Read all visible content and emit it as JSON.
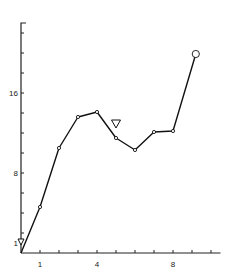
{
  "chart_data": {
    "type": "line",
    "title": "",
    "xlabel": "",
    "ylabel": "",
    "xlim": [
      0,
      10.5
    ],
    "ylim": [
      0,
      23
    ],
    "grid": false,
    "legend": null,
    "x_ticks": [
      1,
      2,
      3,
      4,
      5,
      6,
      7,
      8,
      9,
      10
    ],
    "x_tick_labels": [
      {
        "value": 1,
        "label": "1"
      },
      {
        "value": 4,
        "label": "4"
      },
      {
        "value": 8,
        "label": "8"
      }
    ],
    "y_ticks": [
      2,
      4,
      6,
      8,
      10,
      12,
      14,
      16,
      18,
      20,
      22
    ],
    "y_tick_labels": [
      {
        "value": 1,
        "label": "1"
      },
      {
        "value": 8,
        "label": "8"
      },
      {
        "value": 16,
        "label": "16"
      }
    ],
    "series": [
      {
        "name": "series",
        "x": [
          0,
          1,
          2,
          3,
          4,
          5,
          6,
          7,
          8,
          9.2
        ],
        "values": [
          0,
          4.6,
          10.5,
          13.6,
          14.1,
          11.5,
          10.3,
          12.1,
          12.2,
          19.9
        ],
        "marker": "small-circle",
        "last_marker": "large-open-circle"
      }
    ],
    "annotations": [
      {
        "type": "open-triangle-down",
        "x": 5,
        "y": 12.5,
        "note": "marker above point at x=5"
      },
      {
        "type": "open-triangle-down",
        "x": 0,
        "y": 0.8,
        "note": "small marker at origin"
      }
    ]
  }
}
